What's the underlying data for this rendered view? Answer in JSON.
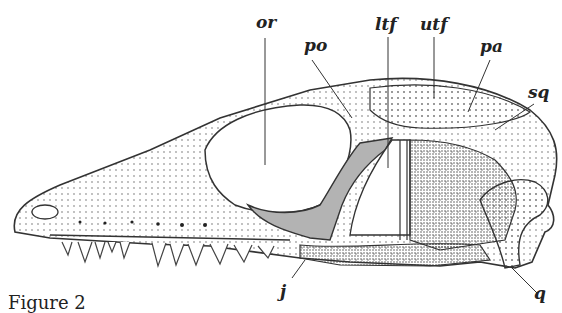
{
  "figure": {
    "caption": "Figure 2",
    "colors": {
      "line": "#333333",
      "stipple": "#444444",
      "highlight": "#b3b3b3",
      "background": "#ffffff"
    },
    "labels": [
      {
        "id": "or",
        "text": "or"
      },
      {
        "id": "po",
        "text": "po"
      },
      {
        "id": "ltf",
        "text": "ltf"
      },
      {
        "id": "utf",
        "text": "utf"
      },
      {
        "id": "pa",
        "text": "pa"
      },
      {
        "id": "sq",
        "text": "sq"
      },
      {
        "id": "j",
        "text": "j"
      },
      {
        "id": "q",
        "text": "q"
      }
    ]
  }
}
